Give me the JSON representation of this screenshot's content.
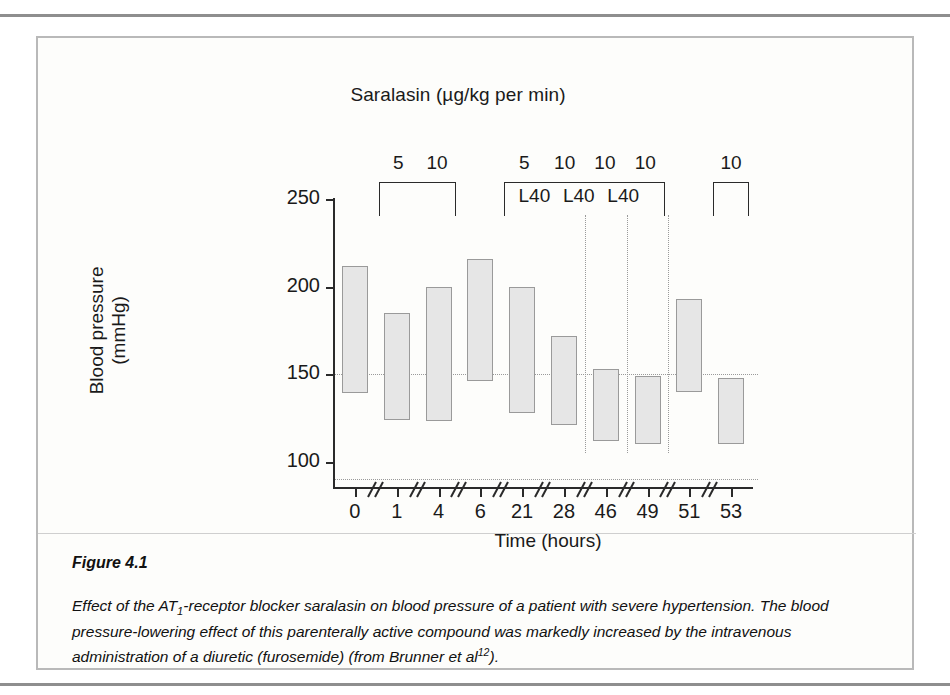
{
  "figure": {
    "number": "Figure 4.1",
    "caption_parts": {
      "before_sub": "Effect of the AT",
      "sub": "1",
      "after_sub": "-receptor blocker saralasin on blood pressure of a patient with severe hypertension. The blood pressure-lowering effect of this parenterally active compound was markedly increased by the intravenous administration of a diuretic (furosemide) (from Brunner et al",
      "sup": "12",
      "tail": ")."
    }
  },
  "chart_data": {
    "type": "bar",
    "variant": "floating-range-bar",
    "title": "Saralasin (µg/kg per min)",
    "xlabel": "Time (hours)",
    "ylabel": "Blood pressure (mmHg)",
    "ylabel_line1": "Blood pressure",
    "ylabel_line2": "(mmHg)",
    "ylim": [
      85,
      250
    ],
    "ytick_labels": [
      "250",
      "200",
      "150",
      "100"
    ],
    "yticks": [
      250,
      200,
      150,
      100
    ],
    "grid": false,
    "axis_breaks": true,
    "categories": [
      "0",
      "1",
      "4",
      "6",
      "21",
      "28",
      "46",
      "49",
      "51",
      "53"
    ],
    "x": [
      0,
      1,
      4,
      6,
      21,
      28,
      46,
      49,
      51,
      53
    ],
    "series": [
      {
        "name": "Systolic",
        "values": [
          212,
          185,
          200,
          216,
          200,
          172,
          153,
          149,
          193,
          148
        ]
      },
      {
        "name": "Diastolic",
        "values": [
          139,
          124,
          123,
          146,
          128,
          121,
          112,
          110,
          140,
          110
        ]
      }
    ],
    "reference_lines": [
      {
        "name": "systolic-target",
        "value": 150,
        "style": "dotted"
      },
      {
        "name": "diastolic-target",
        "value": 90,
        "style": "dotted"
      }
    ],
    "vertical_markers": [
      {
        "label": "L40",
        "after_category": "28"
      },
      {
        "label": "L40",
        "after_category": "46"
      },
      {
        "label": "L40",
        "after_category": "49"
      }
    ],
    "infusion_brackets": [
      {
        "id": "bracket-1",
        "doses": [
          "5",
          "10"
        ],
        "inner_labels": [],
        "span_categories": [
          "1",
          "4"
        ]
      },
      {
        "id": "bracket-2",
        "doses": [
          "5",
          "10",
          "10",
          "10"
        ],
        "inner_labels": [
          "L40",
          "L40",
          "L40"
        ],
        "span_categories": [
          "21",
          "49"
        ]
      },
      {
        "id": "bracket-3",
        "doses": [
          "10"
        ],
        "inner_labels": [],
        "span_categories": [
          "53"
        ]
      }
    ],
    "colors": {
      "bar_fill": "#e6e6e6",
      "bar_stroke": "#9a9a9a",
      "axis": "#2a2a2a",
      "reference_line": "#9a9a9a",
      "text": "#1a1a1a"
    }
  }
}
